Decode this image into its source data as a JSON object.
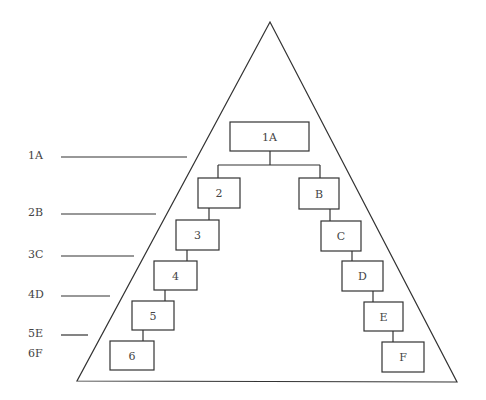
{
  "diagram": {
    "type": "hierarchy-pyramid",
    "triangle": {
      "apex": [
        270,
        22
      ],
      "base_left": [
        77,
        381
      ],
      "base_right": [
        457,
        382
      ]
    },
    "side_labels": [
      {
        "text": "1A",
        "x": 28,
        "y": 159,
        "line": [
          61,
          157,
          187,
          157
        ]
      },
      {
        "text": "2B",
        "x": 28,
        "y": 216,
        "line": [
          61,
          214,
          156,
          214
        ]
      },
      {
        "text": "3C",
        "x": 28,
        "y": 258,
        "line": [
          61,
          256,
          134,
          256
        ]
      },
      {
        "text": "4D",
        "x": 28,
        "y": 298,
        "line": [
          61,
          296,
          110,
          296
        ]
      },
      {
        "text": "5E",
        "x": 28,
        "y": 337,
        "line": [
          61,
          335,
          88,
          335
        ]
      },
      {
        "text": "6F",
        "x": 28,
        "y": 357,
        "line": null
      }
    ],
    "nodes": [
      {
        "id": "1A",
        "label": "1A",
        "x": 230,
        "y": 122,
        "w": 79,
        "h": 29
      },
      {
        "id": "2",
        "label": "2",
        "x": 198,
        "y": 178,
        "w": 42,
        "h": 30
      },
      {
        "id": "3",
        "label": "3",
        "x": 176,
        "y": 220,
        "w": 43,
        "h": 30
      },
      {
        "id": "4",
        "label": "4",
        "x": 154,
        "y": 261,
        "w": 43,
        "h": 29
      },
      {
        "id": "5",
        "label": "5",
        "x": 132,
        "y": 301,
        "w": 42,
        "h": 29
      },
      {
        "id": "6",
        "label": "6",
        "x": 110,
        "y": 341,
        "w": 44,
        "h": 29
      },
      {
        "id": "B",
        "label": "B",
        "x": 299,
        "y": 178,
        "w": 40,
        "h": 31
      },
      {
        "id": "C",
        "label": "C",
        "x": 321,
        "y": 221,
        "w": 40,
        "h": 30
      },
      {
        "id": "D",
        "label": "D",
        "x": 342,
        "y": 261,
        "w": 41,
        "h": 30
      },
      {
        "id": "E",
        "label": "E",
        "x": 364,
        "y": 302,
        "w": 39,
        "h": 29
      },
      {
        "id": "F",
        "label": "F",
        "x": 382,
        "y": 342,
        "w": 42,
        "h": 30
      }
    ],
    "connectors": [
      [
        270,
        151,
        270,
        165
      ],
      [
        218,
        165,
        320,
        165
      ],
      [
        218,
        165,
        218,
        178
      ],
      [
        320,
        165,
        320,
        178
      ],
      [
        209,
        208,
        209,
        220
      ],
      [
        187,
        250,
        187,
        261
      ],
      [
        165,
        290,
        165,
        301
      ],
      [
        143,
        330,
        143,
        341
      ],
      [
        330,
        209,
        330,
        221
      ],
      [
        352,
        251,
        352,
        261
      ],
      [
        373,
        291,
        373,
        302
      ],
      [
        393,
        331,
        393,
        342
      ]
    ]
  }
}
